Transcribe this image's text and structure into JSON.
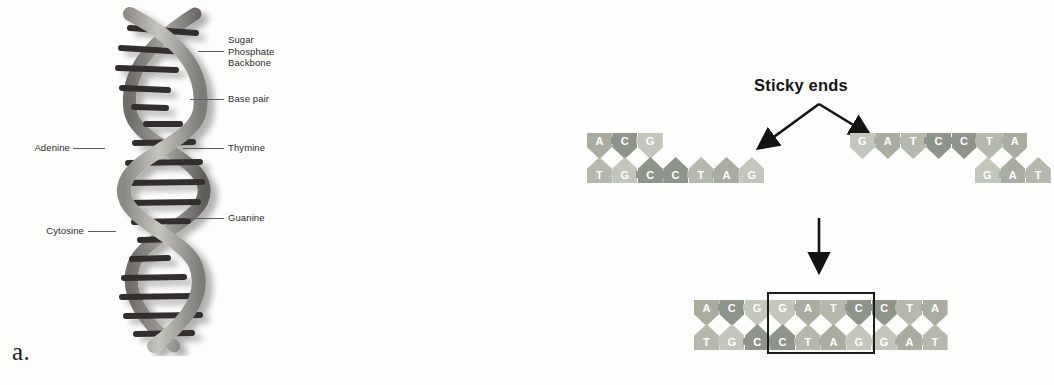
{
  "figure": {
    "panel_a_label": "a.",
    "panel_b_label": "b."
  },
  "panel_a": {
    "subject": "dna-double-helix",
    "callouts": [
      {
        "name": "sugar-phosphate-backbone",
        "text": "Sugar\nPhosphate\nBackbone",
        "side": "right"
      },
      {
        "name": "base-pair",
        "text": "Base pair",
        "side": "right"
      },
      {
        "name": "thymine",
        "text": "Thymine",
        "side": "right"
      },
      {
        "name": "guanine",
        "text": "Guanine",
        "side": "right"
      },
      {
        "name": "adenine",
        "text": "Adenine",
        "side": "left"
      },
      {
        "name": "cytosine",
        "text": "Cytosine",
        "side": "left"
      }
    ],
    "colors": {
      "ribbon_light": "#b9b7b2",
      "ribbon_dark": "#7d7b77",
      "rung": "#2f2e2c",
      "leader_line": "#5d5d5d",
      "text": "#2c2c2c"
    }
  },
  "panel_b": {
    "title": "Sticky ends",
    "arrows": {
      "sticky_left_arrow": "arrow-down-left",
      "sticky_right_arrow": "arrow-down-right",
      "reaction_arrow": "arrow-down"
    },
    "fragment_left": {
      "name": "dna-fragment-left",
      "top_strand": [
        "A",
        "C",
        "G"
      ],
      "bottom_strand": [
        "T",
        "G",
        "C",
        "C",
        "T",
        "A",
        "G"
      ]
    },
    "fragment_right": {
      "name": "dna-fragment-right",
      "top_strand": [
        "G",
        "A",
        "T",
        "C",
        "C",
        "T",
        "A"
      ],
      "bottom_strand": [
        "G",
        "A",
        "T"
      ]
    },
    "ligated_fragment": {
      "name": "dna-fragment-ligated",
      "top_strand": [
        "A",
        "C",
        "G",
        "G",
        "A",
        "T",
        "C",
        "C",
        "T",
        "A"
      ],
      "bottom_strand": [
        "T",
        "G",
        "C",
        "C",
        "T",
        "A",
        "G",
        "G",
        "A",
        "T"
      ],
      "highlight_box_start_index": 3,
      "highlight_box_end_index": 6
    },
    "colors": {
      "base_A": "#a9ada0",
      "base_C": "#8f948a",
      "base_G": "#c3c6bb",
      "base_T": "#b5b9ad",
      "arrow": "#131313",
      "box": "#1c1c1c",
      "letter": "#ffffff"
    }
  }
}
